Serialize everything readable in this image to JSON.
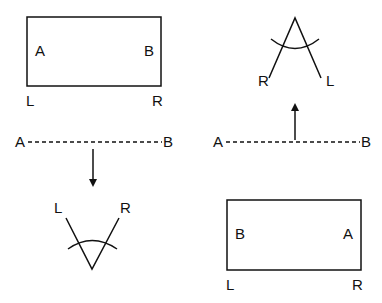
{
  "diagram": {
    "panels": [
      {
        "id": "top-left-rectangle",
        "shape": "rectangle",
        "inner_labels": {
          "left": "A",
          "right": "B"
        },
        "corner_labels": {
          "bottom_left": "L",
          "bottom_right": "R"
        }
      },
      {
        "id": "top-right-v",
        "shape": "inverted-v-with-arc",
        "end_labels": {
          "left": "R",
          "right": "L"
        }
      },
      {
        "id": "left-dashed-line",
        "shape": "dashed-line",
        "end_labels": {
          "left": "A",
          "right": "B"
        },
        "arrow": "down"
      },
      {
        "id": "right-dashed-line",
        "shape": "dashed-line",
        "end_labels": {
          "left": "A",
          "right": "B"
        },
        "arrow": "up"
      },
      {
        "id": "bottom-left-v",
        "shape": "v-with-arc",
        "end_labels": {
          "left": "L",
          "right": "R"
        }
      },
      {
        "id": "bottom-right-rectangle",
        "shape": "rectangle",
        "inner_labels": {
          "left": "B",
          "right": "A"
        },
        "corner_labels": {
          "bottom_left": "L",
          "bottom_right": "R"
        }
      }
    ],
    "colors": {
      "stroke": "#111111",
      "background": "#ffffff"
    }
  }
}
